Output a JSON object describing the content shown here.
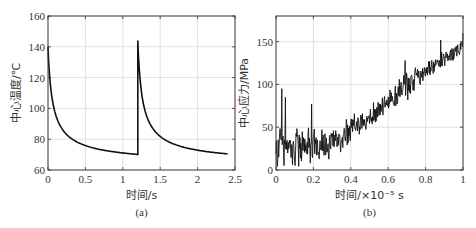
{
  "chart_data": [
    {
      "type": "line",
      "panel": "(a)",
      "xlabel": "时间/s",
      "ylabel": "中心温度/℃",
      "xlim": [
        0,
        2.5
      ],
      "ylim": [
        60,
        160
      ],
      "xticks": [
        "0",
        "0.5",
        "1",
        "1.5",
        "2",
        "2.5"
      ],
      "yticks": [
        "60",
        "80",
        "100",
        "120",
        "140",
        "160"
      ],
      "grid": true,
      "series": [
        {
          "name": "center temperature",
          "x": [
            0,
            0.02,
            0.05,
            0.1,
            0.15,
            0.2,
            0.3,
            0.4,
            0.5,
            0.7,
            0.9,
            1.1,
            1.2,
            1.2,
            1.22,
            1.25,
            1.3,
            1.35,
            1.4,
            1.5,
            1.6,
            1.7,
            1.9,
            2.1,
            2.3,
            2.4
          ],
          "y": [
            140,
            120,
            103,
            89,
            82,
            78.5,
            75,
            73,
            72,
            70.5,
            69.3,
            68.5,
            68,
            144,
            124,
            107,
            93,
            86,
            82.5,
            78.5,
            76,
            74,
            72,
            70.8,
            69.8,
            69.5
          ]
        }
      ]
    },
    {
      "type": "line",
      "panel": "(b)",
      "xlabel": "时间/×10⁻⁵ s",
      "ylabel": "中心应力/MPa",
      "xlim": [
        0,
        1
      ],
      "ylim": [
        0,
        180
      ],
      "xticks": [
        "0",
        "0.2",
        "0.4",
        "0.6",
        "0.8",
        "1"
      ],
      "yticks": [
        "0",
        "50",
        "100",
        "150"
      ],
      "grid": true,
      "series": [
        {
          "name": "center stress (noisy)",
          "trend_x": [
            0,
            0.1,
            0.2,
            0.25,
            0.3,
            0.4,
            0.5,
            0.6,
            0.7,
            0.8,
            0.9,
            1.0
          ],
          "trend_y": [
            25,
            28,
            27,
            26,
            32,
            48,
            62,
            78,
            100,
            115,
            130,
            145
          ],
          "noise_amplitude": [
            35,
            30,
            28,
            25,
            22,
            18,
            16,
            18,
            20,
            12,
            12,
            12
          ],
          "notable_peaks": [
            {
              "x": 0.03,
              "y": 95
            },
            {
              "x": 0.05,
              "y": 85
            },
            {
              "x": 0.19,
              "y": 77
            },
            {
              "x": 0.69,
              "y": 128
            },
            {
              "x": 0.88,
              "y": 152
            },
            {
              "x": 1.0,
              "y": 160
            }
          ]
        }
      ]
    }
  ],
  "captions": {
    "a": "(a)",
    "b": "(b)"
  },
  "colors": {
    "line": "#111111",
    "grid": "#d9d9d9",
    "axis": "#333333"
  }
}
